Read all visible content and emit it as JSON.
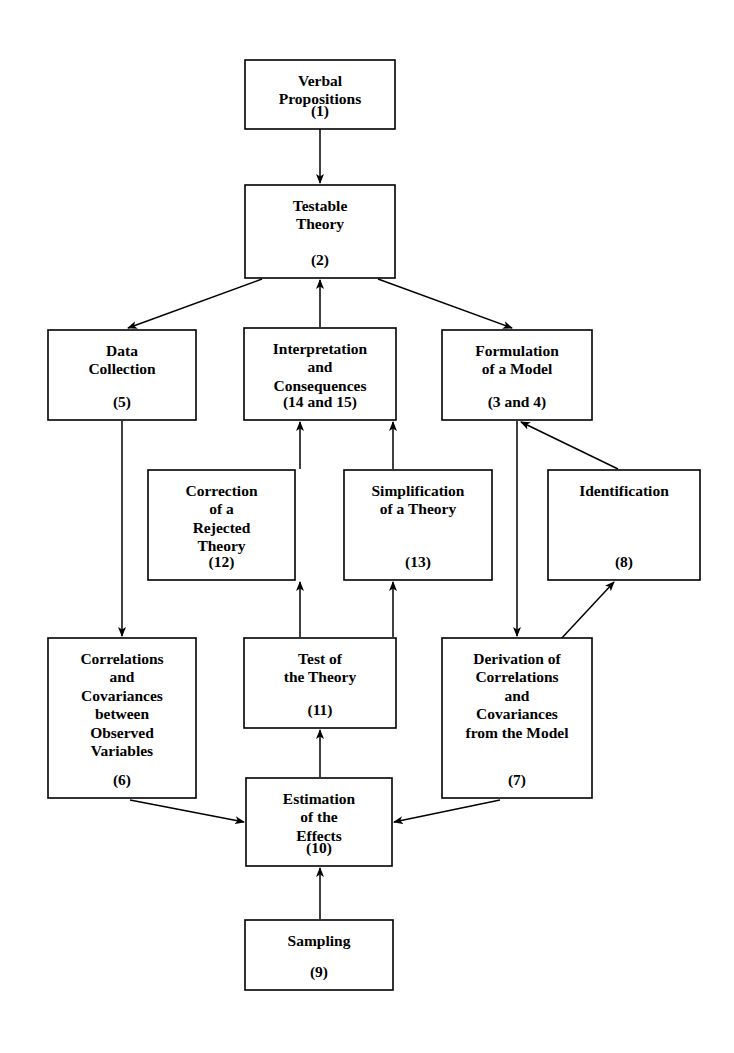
{
  "diagram": {
    "background_color": "#ffffff",
    "line_color": "#000000",
    "text_color": "#000000",
    "nodes": [
      {
        "id": "verbal-propositions",
        "lines": [
          "Verbal",
          "Propositions"
        ],
        "index": "(1)",
        "x": 245,
        "y": 60,
        "w": 150,
        "h": 69
      },
      {
        "id": "testable-theory",
        "lines": [
          "Testable",
          "Theory"
        ],
        "index": "(2)",
        "x": 245,
        "y": 185,
        "w": 150,
        "h": 93
      },
      {
        "id": "data-collection",
        "lines": [
          "Data",
          "Collection"
        ],
        "index": "(5)",
        "x": 48,
        "y": 330,
        "w": 148,
        "h": 90
      },
      {
        "id": "interpretation-and-consequences",
        "lines": [
          "Interpretation",
          "and",
          "Consequences"
        ],
        "index": "(14 and 15)",
        "x": 244,
        "y": 328,
        "w": 152,
        "h": 92
      },
      {
        "id": "formulation-of-a-model",
        "lines": [
          "Formulation",
          "of a Model"
        ],
        "index": "(3 and 4)",
        "x": 442,
        "y": 330,
        "w": 150,
        "h": 90
      },
      {
        "id": "correction-of-a-rejected-theory",
        "lines": [
          "Correction",
          "of a",
          "Rejected",
          "Theory"
        ],
        "index": "(12)",
        "x": 148,
        "y": 470,
        "w": 147,
        "h": 110
      },
      {
        "id": "simplification-of-a-theory",
        "lines": [
          "Simplification",
          "of a Theory"
        ],
        "index": "(13)",
        "x": 344,
        "y": 470,
        "w": 148,
        "h": 110
      },
      {
        "id": "identification",
        "lines": [
          "Identification"
        ],
        "index": "(8)",
        "x": 548,
        "y": 470,
        "w": 152,
        "h": 110
      },
      {
        "id": "correlations-covariances-observed",
        "lines": [
          "Correlations",
          "and",
          "Covariances",
          "between",
          "Observed",
          "Variables"
        ],
        "index": "(6)",
        "x": 48,
        "y": 638,
        "w": 148,
        "h": 160
      },
      {
        "id": "test-of-the-theory",
        "lines": [
          "Test of",
          "the Theory"
        ],
        "index": "(11)",
        "x": 244,
        "y": 638,
        "w": 152,
        "h": 90
      },
      {
        "id": "derivation-from-the-model",
        "lines": [
          "Derivation of",
          "Correlations",
          "and",
          "Covariances",
          "from the Model"
        ],
        "index": "(7)",
        "x": 442,
        "y": 638,
        "w": 150,
        "h": 160
      },
      {
        "id": "estimation-of-the-effects",
        "lines": [
          "Estimation",
          "of the",
          "Effects"
        ],
        "index": "(10)",
        "x": 246,
        "y": 778,
        "w": 146,
        "h": 88
      },
      {
        "id": "sampling",
        "lines": [
          "Sampling"
        ],
        "index": "(9)",
        "x": 245,
        "y": 920,
        "w": 148,
        "h": 70
      }
    ],
    "edges": [
      {
        "id": "verbal-to-testable",
        "from": "verbal-propositions",
        "to": "testable-theory",
        "style": "straight-vertical"
      },
      {
        "id": "testable-to-data",
        "from": "testable-theory",
        "to": "data-collection",
        "style": "diagonal"
      },
      {
        "id": "testable-to-formulation",
        "from": "testable-theory",
        "to": "formulation-of-a-model",
        "style": "diagonal"
      },
      {
        "id": "interpretation-to-testable",
        "from": "interpretation-and-consequences",
        "to": "testable-theory",
        "style": "straight-vertical"
      },
      {
        "id": "data-to-correlations",
        "from": "data-collection",
        "to": "correlations-covariances-observed",
        "style": "straight-vertical"
      },
      {
        "id": "correction-to-interpretation",
        "from": "correction-of-a-rejected-theory",
        "to": "interpretation-and-consequences",
        "style": "straight-vertical"
      },
      {
        "id": "simplification-to-interpretation",
        "from": "simplification-of-a-theory",
        "to": "interpretation-and-consequences",
        "style": "straight-vertical"
      },
      {
        "id": "identification-to-formulation",
        "from": "identification",
        "to": "formulation-of-a-model",
        "style": "diagonal"
      },
      {
        "id": "formulation-to-derivation",
        "from": "formulation-of-a-model",
        "to": "derivation-from-the-model",
        "style": "straight-vertical"
      },
      {
        "id": "derivation-to-identification",
        "from": "derivation-from-the-model",
        "to": "identification",
        "style": "diagonal"
      },
      {
        "id": "test-to-correction",
        "from": "test-of-the-theory",
        "to": "correction-of-a-rejected-theory",
        "style": "elbow"
      },
      {
        "id": "test-to-simplification",
        "from": "test-of-the-theory",
        "to": "simplification-of-a-theory",
        "style": "straight-vertical"
      },
      {
        "id": "estimation-to-test",
        "from": "estimation-of-the-effects",
        "to": "test-of-the-theory",
        "style": "straight-vertical"
      },
      {
        "id": "correlations-to-estimation",
        "from": "correlations-covariances-observed",
        "to": "estimation-of-the-effects",
        "style": "diagonal"
      },
      {
        "id": "derivation-to-estimation",
        "from": "derivation-from-the-model",
        "to": "estimation-of-the-effects",
        "style": "diagonal"
      },
      {
        "id": "sampling-to-estimation",
        "from": "sampling",
        "to": "estimation-of-the-effects",
        "style": "straight-vertical"
      }
    ]
  }
}
